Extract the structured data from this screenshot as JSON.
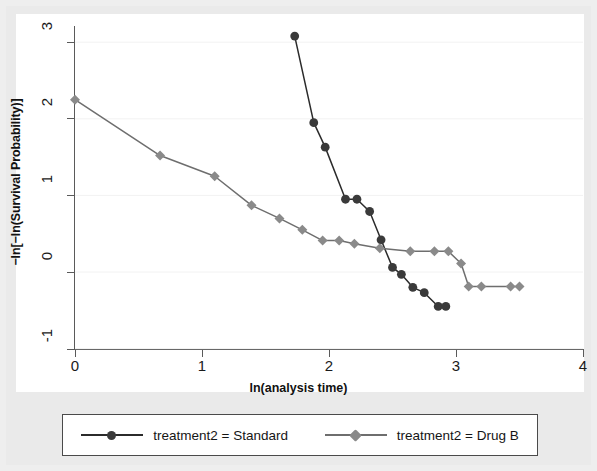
{
  "chart_data": {
    "type": "line",
    "title": "",
    "subtitle": "",
    "xlabel": "ln(analysis time)",
    "ylabel": "−ln[−ln(Survival Probability)]",
    "xlim": [
      -0.12,
      4.0
    ],
    "ylim": [
      -1.0,
      3.28
    ],
    "xticks": [
      0,
      1,
      2,
      3,
      4
    ],
    "xticklabels": [
      "0",
      "1",
      "2",
      "3",
      "4"
    ],
    "yticks": [
      -1,
      0,
      1,
      2,
      3
    ],
    "yticklabels": [
      "-1",
      "0",
      "1",
      "2",
      "3"
    ],
    "grid": "horizontal-faint",
    "legend_position": "below-plot",
    "series": [
      {
        "name": "treatment2 = Standard",
        "marker": "circle",
        "color": "#3a3a3a",
        "line_color": "#2b2b2b",
        "x": [
          1.73,
          1.88,
          1.97,
          2.13,
          2.22,
          2.32,
          2.41,
          2.5,
          2.57,
          2.66,
          2.75,
          2.86,
          2.92
        ],
        "y": [
          3.08,
          1.95,
          1.63,
          0.95,
          0.95,
          0.79,
          0.42,
          0.06,
          -0.03,
          -0.2,
          -0.27,
          -0.45,
          -0.45
        ]
      },
      {
        "name": "treatment2 = Drug B",
        "marker": "diamond",
        "color": "#8a8a8a",
        "line_color": "#6e6e6e",
        "x": [
          0.0,
          0.67,
          1.1,
          1.39,
          1.61,
          1.79,
          1.95,
          2.08,
          2.2,
          2.4,
          2.64,
          2.83,
          2.94,
          3.04,
          3.1,
          3.2,
          3.43,
          3.5
        ],
        "y": [
          2.25,
          1.52,
          1.25,
          0.87,
          0.7,
          0.55,
          0.41,
          0.41,
          0.37,
          0.31,
          0.27,
          0.27,
          0.27,
          0.11,
          -0.19,
          -0.19,
          -0.19,
          -0.19
        ]
      }
    ]
  },
  "legend": {
    "entries": [
      {
        "label": "treatment2 = Standard",
        "marker": "circle",
        "color": "#3a3a3a"
      },
      {
        "label": "treatment2 = Drug B",
        "marker": "diamond",
        "color": "#8a8a8a"
      }
    ]
  },
  "axes": {
    "x_title": "ln(analysis time)",
    "y_title": "−ln[−ln(Survival Probability)]",
    "x_tick_labels": [
      "0",
      "1",
      "2",
      "3",
      "4"
    ],
    "y_tick_labels": [
      "3",
      "2",
      "1",
      "0",
      "-1"
    ]
  }
}
